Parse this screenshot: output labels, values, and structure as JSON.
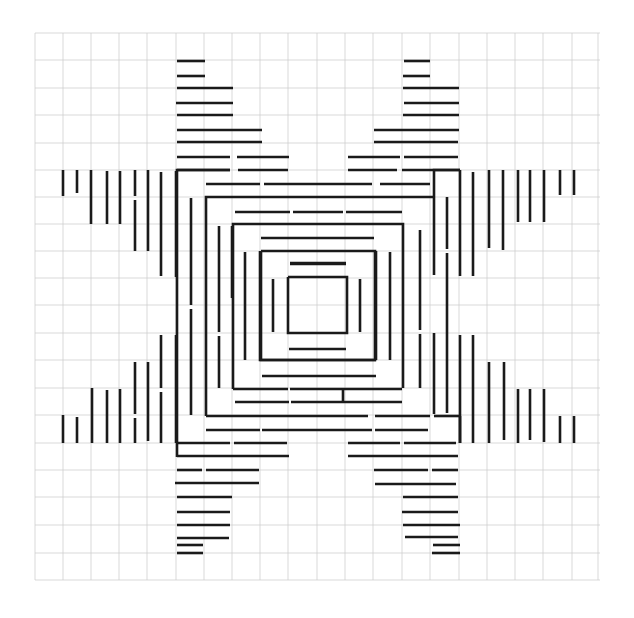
{
  "figure": {
    "width": 634,
    "height": 618,
    "colors": {
      "paper": "#ffffff",
      "grid": "#cfcfcf",
      "ink": "#1a1a1a"
    }
  },
  "grid": {
    "x_lines": [
      35,
      63,
      91,
      119,
      147,
      176,
      204,
      232,
      260,
      288,
      317,
      345,
      373,
      402,
      430,
      459,
      487,
      515,
      543,
      572,
      598
    ],
    "y_lines": [
      33,
      60,
      88,
      115,
      143,
      170,
      197,
      224,
      251,
      278,
      305,
      333,
      360,
      388,
      415,
      443,
      470,
      497,
      525,
      553,
      580
    ],
    "x_extent": [
      35,
      600
    ],
    "y_extent": [
      33,
      580
    ]
  },
  "center": {
    "outer_square": [
      261,
      251,
      375,
      360
    ],
    "inner_square": [
      288,
      277,
      347,
      333
    ],
    "dashes": [
      [
        290,
        263,
        346,
        263
      ],
      [
        289,
        349,
        346,
        349
      ],
      [
        273,
        279,
        273,
        332
      ],
      [
        360,
        279,
        360,
        332
      ]
    ]
  },
  "segments": {
    "top_arm_left": [
      [
        177,
        61,
        205,
        61
      ],
      [
        177,
        76,
        205,
        76
      ],
      [
        177,
        88,
        233,
        88
      ],
      [
        176,
        103,
        233,
        103
      ],
      [
        177,
        115,
        233,
        115
      ],
      [
        177,
        130,
        262,
        130
      ],
      [
        177,
        142,
        262,
        142
      ],
      [
        177,
        157,
        230,
        157
      ],
      [
        237,
        157,
        289,
        157
      ],
      [
        177,
        170,
        230,
        170
      ],
      [
        238,
        170,
        288,
        170
      ]
    ],
    "top_arm_right": [
      [
        404,
        61,
        430,
        61
      ],
      [
        403,
        76,
        430,
        76
      ],
      [
        403,
        88,
        459,
        88
      ],
      [
        404,
        103,
        459,
        103
      ],
      [
        403,
        115,
        459,
        115
      ],
      [
        374,
        130,
        459,
        130
      ],
      [
        374,
        142,
        458,
        142
      ],
      [
        348,
        157,
        400,
        157
      ],
      [
        404,
        157,
        458,
        157
      ],
      [
        348,
        170,
        397,
        170
      ],
      [
        402,
        170,
        460,
        170
      ]
    ],
    "left_arm_top": [
      [
        63,
        170,
        63,
        196
      ],
      [
        77,
        170,
        77,
        193
      ],
      [
        91,
        170,
        91,
        224
      ],
      [
        107,
        171,
        107,
        224
      ],
      [
        120,
        171,
        120,
        224
      ],
      [
        135,
        170,
        135,
        196
      ],
      [
        135,
        200,
        135,
        251
      ],
      [
        148,
        170,
        148,
        251
      ],
      [
        161,
        172,
        161,
        276
      ],
      [
        176,
        171,
        176,
        277
      ]
    ],
    "left_arm_bottom": [
      [
        63,
        415,
        63,
        443
      ],
      [
        77,
        417,
        77,
        443
      ],
      [
        92,
        388,
        92,
        443
      ],
      [
        107,
        390,
        107,
        443
      ],
      [
        120,
        389,
        120,
        443
      ],
      [
        135,
        362,
        135,
        414
      ],
      [
        135,
        418,
        135,
        443
      ],
      [
        148,
        362,
        148,
        441
      ],
      [
        161,
        335,
        161,
        388
      ],
      [
        161,
        392,
        161,
        443
      ],
      [
        176,
        335,
        176,
        443
      ]
    ],
    "right_arm_top": [
      [
        460,
        170,
        460,
        276
      ],
      [
        473,
        172,
        473,
        276
      ],
      [
        489,
        170,
        489,
        248
      ],
      [
        503,
        170,
        503,
        250
      ],
      [
        518,
        170,
        518,
        222
      ],
      [
        530,
        170,
        530,
        222
      ],
      [
        544,
        170,
        544,
        222
      ],
      [
        560,
        170,
        560,
        195
      ],
      [
        574,
        170,
        574,
        195
      ]
    ],
    "right_arm_bottom": [
      [
        460,
        335,
        460,
        443
      ],
      [
        473,
        335,
        473,
        443
      ],
      [
        489,
        362,
        489,
        443
      ],
      [
        504,
        362,
        504,
        440
      ],
      [
        518,
        389,
        518,
        443
      ],
      [
        530,
        389,
        530,
        440
      ],
      [
        544,
        389,
        544,
        442
      ],
      [
        560,
        416,
        560,
        443
      ],
      [
        574,
        416,
        574,
        443
      ]
    ],
    "bottom_arm_left": [
      [
        177,
        443,
        230,
        443
      ],
      [
        234,
        443,
        287,
        443
      ],
      [
        177,
        456,
        289,
        456
      ],
      [
        177,
        470,
        202,
        470
      ],
      [
        206,
        470,
        259,
        470
      ],
      [
        175,
        483,
        259,
        483
      ],
      [
        177,
        497,
        232,
        497
      ],
      [
        177,
        512,
        230,
        512
      ],
      [
        177,
        525,
        230,
        525
      ],
      [
        177,
        538,
        229,
        538
      ],
      [
        177,
        545,
        203,
        545
      ],
      [
        177,
        553,
        203,
        553
      ]
    ],
    "bottom_arm_right": [
      [
        348,
        443,
        400,
        443
      ],
      [
        404,
        443,
        456,
        443
      ],
      [
        348,
        456,
        458,
        456
      ],
      [
        374,
        470,
        428,
        470
      ],
      [
        432,
        470,
        458,
        470
      ],
      [
        375,
        484,
        456,
        484
      ],
      [
        403,
        497,
        458,
        497
      ],
      [
        402,
        512,
        458,
        512
      ],
      [
        403,
        525,
        460,
        525
      ],
      [
        405,
        537,
        458,
        537
      ],
      [
        433,
        545,
        460,
        545
      ],
      [
        432,
        553,
        460,
        553
      ]
    ],
    "inner_top_left": [
      [
        206,
        184,
        260,
        184
      ],
      [
        264,
        184,
        372,
        184
      ],
      [
        380,
        184,
        430,
        184
      ],
      [
        235,
        212,
        290,
        212
      ],
      [
        293,
        212,
        343,
        212
      ],
      [
        346,
        212,
        402,
        212
      ],
      [
        261,
        238,
        374,
        238
      ],
      [
        290,
        264,
        346,
        264
      ]
    ],
    "inner_bottom": [
      [
        262,
        376,
        376,
        376
      ],
      [
        235,
        402,
        289,
        402
      ],
      [
        291,
        402,
        402,
        402
      ],
      [
        206,
        430,
        260,
        430
      ],
      [
        262,
        430,
        372,
        430
      ],
      [
        375,
        430,
        428,
        430
      ]
    ],
    "inner_left_verticals": [
      [
        191,
        198,
        191,
        305
      ],
      [
        191,
        309,
        191,
        415
      ],
      [
        219,
        226,
        219,
        332
      ],
      [
        219,
        336,
        219,
        388
      ],
      [
        245,
        252,
        245,
        360
      ],
      [
        232,
        226,
        232,
        298
      ]
    ],
    "inner_right_verticals": [
      [
        447,
        197,
        447,
        249
      ],
      [
        447,
        253,
        447,
        413
      ],
      [
        420,
        230,
        420,
        330
      ],
      [
        420,
        334,
        420,
        388
      ],
      [
        390,
        252,
        390,
        360
      ]
    ]
  },
  "corners": [
    [
      177,
      443,
      177,
      170,
      230,
      170
    ],
    [
      206,
      416,
      206,
      197,
      262,
      197
    ],
    [
      233,
      389,
      233,
      224,
      288,
      224
    ],
    [
      460,
      170,
      434,
      170,
      434,
      197
    ],
    [
      434,
      197,
      434,
      275
    ],
    [
      376,
      197,
      434,
      197
    ],
    [
      348,
      224,
      403,
      224,
      403,
      305
    ],
    [
      376,
      251,
      376,
      360
    ],
    [
      260,
      251,
      260,
      360,
      376,
      360
    ],
    [
      262,
      197,
      376,
      197
    ],
    [
      288,
      224,
      348,
      224
    ],
    [
      288,
      277,
      288,
      277
    ],
    [
      177,
      457,
      177,
      443
    ],
    [
      206,
      416,
      368,
      416
    ],
    [
      233,
      389,
      288,
      389
    ],
    [
      290,
      389,
      402,
      389
    ],
    [
      343,
      388,
      343,
      402
    ],
    [
      403,
      305,
      403,
      388
    ],
    [
      434,
      333,
      434,
      414
    ],
    [
      434,
      416,
      460,
      416
    ],
    [
      460,
      416,
      460,
      443
    ],
    [
      375,
      416,
      430,
      416
    ]
  ],
  "caption": "Graph-paper line drawing"
}
